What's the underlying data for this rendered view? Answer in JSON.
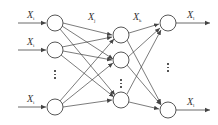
{
  "diagram": {
    "type": "feed-forward neural network",
    "colors": {
      "stroke": "#444444",
      "node_fill": "#ffffff",
      "text": "#333333"
    },
    "layers": [
      {
        "name": "input",
        "x": 55,
        "nodes_y": [
          23,
          50,
          107
        ],
        "ellipsis_y": 70
      },
      {
        "name": "hidden",
        "x": 121,
        "nodes_y": [
          35,
          60,
          100
        ],
        "ellipsis_y": 79
      },
      {
        "name": "output",
        "x": 168,
        "nodes_y": [
          23,
          110
        ],
        "ellipsis_y": 63
      }
    ],
    "node_radius": 8,
    "labels": {
      "input_top": {
        "base": "X",
        "sub": "i"
      },
      "input_middle": {
        "base": "X",
        "sub": "i"
      },
      "input_bottom": {
        "base": "X",
        "sub": "i"
      },
      "hidden_edge": {
        "base": "X",
        "sub": "j"
      },
      "output_edge": {
        "base": "X",
        "sub": "k"
      },
      "final_top": {
        "base": "X",
        "sub": "l"
      },
      "final_bottom": {
        "base": "X",
        "sub": "l"
      }
    },
    "ellipsis_glyph": "⋮"
  }
}
